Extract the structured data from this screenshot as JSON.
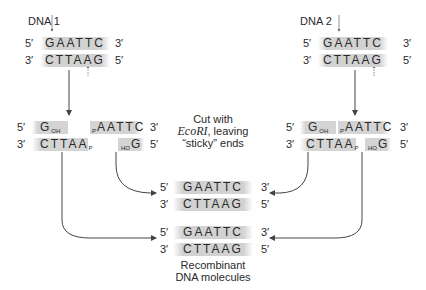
{
  "dna1": {
    "label": "DNA 1",
    "top_strand": {
      "five": "5′",
      "seq": "GAATTC",
      "three": "3′"
    },
    "bottom_strand": {
      "three": "3′",
      "seq": "CTTAAG",
      "five": "5′"
    }
  },
  "dna2": {
    "label": "DNA 2",
    "top_strand": {
      "five": "5′",
      "seq": "GAATTC",
      "three": "3′"
    },
    "bottom_strand": {
      "three": "3′",
      "seq": "CTTAAG",
      "five": "5′"
    }
  },
  "cut1": {
    "top_left_end": "5′",
    "top_left_base": "G",
    "top_left_sub": "OH",
    "top_right_pre": "P",
    "top_right_seq": "AATTC",
    "top_right_end": "3′",
    "bottom_left_end": "3′",
    "bottom_left_seq": "CTTAA",
    "bottom_left_sub": "P",
    "bottom_right_pre": "HO",
    "bottom_right_base": "G",
    "bottom_right_end": "5′"
  },
  "cut2": {
    "top_left_end": "5′",
    "top_left_base": "G",
    "top_left_sub": "OH",
    "top_right_pre": "P",
    "top_right_seq": "AATTC",
    "top_right_end": "3′",
    "bottom_left_end": "3′",
    "bottom_left_seq": "CTTAA",
    "bottom_left_sub": "P",
    "bottom_right_pre": "HO",
    "bottom_right_base": "G",
    "bottom_right_end": "5′"
  },
  "caption": {
    "line1": "Cut with",
    "enzyme": "EcoRI",
    "line2_rest": ", leaving",
    "line3": "“sticky” ends"
  },
  "recombinant1": {
    "top": {
      "five": "5′",
      "seq": "GAATTC",
      "three": "3′"
    },
    "bottom": {
      "three": "3′",
      "seq": "CTTAAG",
      "five": "5′"
    }
  },
  "recombinant2": {
    "top": {
      "five": "5′",
      "seq": "GAATTC",
      "three": "3′"
    },
    "bottom": {
      "three": "3′",
      "seq": "CTTAAG",
      "five": "5′"
    }
  },
  "result_label": {
    "line1": "Recombinant",
    "line2": "DNA molecules"
  },
  "colors": {
    "strand_shade": "#d2d2d2",
    "text": "#2a2a2a",
    "arrow": "#444444"
  }
}
